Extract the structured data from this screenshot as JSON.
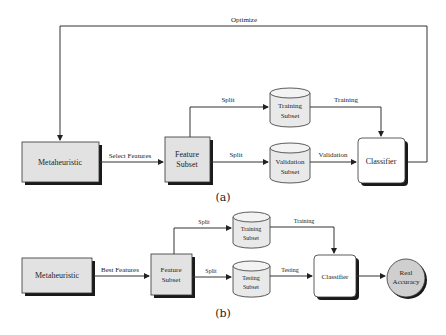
{
  "diagram_a": {
    "caption": "(a)",
    "loop_label": "Optimize",
    "nodes": {
      "metaheuristic": "Metaheuristic",
      "feature_subset": [
        "Feature",
        "Subset"
      ],
      "training_subset": [
        "Training",
        "Subset"
      ],
      "validation_subset": [
        "Validation",
        "Subset"
      ],
      "classifier": "Classifier"
    },
    "edges": {
      "select_features": "Select Features",
      "split_top": "Split",
      "split_bottom": "Split",
      "training": "Training",
      "validation": "Validation"
    }
  },
  "diagram_b": {
    "caption": "(b)",
    "nodes": {
      "metaheuristic": "Metaheuristic",
      "feature_subset": [
        "Feature",
        "Subset"
      ],
      "training_subset": [
        "Training",
        "Subset"
      ],
      "testing_subset": [
        "Testing",
        "Subset"
      ],
      "classifier": "Classifier",
      "real_accuracy": [
        "Real",
        "Accuracy"
      ]
    },
    "edges": {
      "best_features": "Best Features",
      "split_top": "Split",
      "split_bottom": "Split",
      "training": "Training",
      "testing": "Testing"
    }
  },
  "colors": {
    "box_fill": "#e2e2e2",
    "shadow": "#1a1a1a",
    "line": "#333333",
    "circle_fill": "#cfcfcf"
  }
}
